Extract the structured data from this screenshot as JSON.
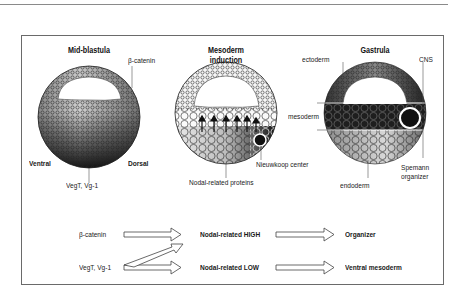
{
  "figure": {
    "panels": [
      {
        "title": "Mid-blastula",
        "labels": {
          "beta_catenin": "β-catenin",
          "ventral": "Ventral",
          "dorsal": "Dorsal",
          "vegt": "VegT, Vg-1"
        }
      },
      {
        "title_line1": "Mesoderm",
        "title_line2": "induction",
        "labels": {
          "nieuwkoop": "Nieuwkoop center",
          "nodal": "Nodal-related proteins"
        }
      },
      {
        "title": "Gastrula",
        "labels": {
          "ectoderm": "ectoderm",
          "cns": "CNS",
          "mesoderm": "mesoderm",
          "endoderm": "endoderm",
          "spemann_line1": "Spemann",
          "spemann_line2": "organizer"
        }
      }
    ],
    "pathway": {
      "row1": {
        "input": "β-catenin",
        "middle": "Nodal-related HIGH",
        "output": "Organizer"
      },
      "row2": {
        "input": "VegT, Vg-1",
        "middle": "Nodal-related LOW",
        "output": "Ventral mesoderm"
      }
    }
  }
}
